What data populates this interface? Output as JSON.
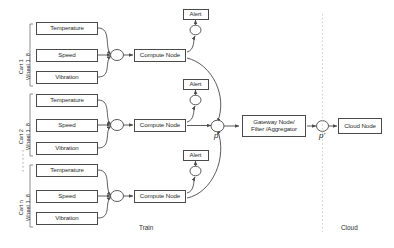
{
  "diagram": {
    "zones": [
      {
        "id": "train",
        "label": "Train"
      },
      {
        "id": "cloud",
        "label": "Cloud"
      }
    ],
    "carts": [
      {
        "id": "cart-1",
        "label_line1": "Cart 1",
        "label_line2": "Wheel 1..8",
        "sensors": [
          "Temperature",
          "Speed",
          "Vibration"
        ],
        "compute_node": "Compute Node",
        "alert": "Alert"
      },
      {
        "id": "cart-2",
        "label_line1": "Cart 2",
        "label_line2": "Wheel 1..8",
        "sensors": [
          "Temperature",
          "Speed",
          "Vibration"
        ],
        "compute_node": "Compute Node",
        "alert": "Alert"
      },
      {
        "id": "cart-n",
        "label_line1": "Cart n",
        "label_line2": "Wheel 1..8",
        "sensors": [
          "Temperature",
          "Speed",
          "Vibration"
        ],
        "compute_node": "Compute Node",
        "alert": "Alert"
      }
    ],
    "junctions": [
      {
        "id": "p",
        "label": "p"
      },
      {
        "id": "p-prime",
        "label": "p'"
      }
    ],
    "gateway": {
      "line1": "Gateway Node/",
      "line2": "Filter /Aggregator"
    },
    "cloud_node": "Cloud Node",
    "colors": {
      "stroke": "#4a4a4a",
      "text": "#2b2b2b",
      "background": "#ffffff",
      "divider": "#bdbdbd"
    }
  }
}
